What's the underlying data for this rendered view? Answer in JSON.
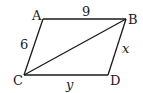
{
  "figure": {
    "type": "parallelogram",
    "vertices": [
      "A",
      "B",
      "C",
      "D"
    ],
    "edges": [
      {
        "from": "A",
        "to": "B",
        "label": "9"
      },
      {
        "from": "B",
        "to": "D",
        "label": "x"
      },
      {
        "from": "C",
        "to": "D",
        "label": "y"
      },
      {
        "from": "A",
        "to": "C",
        "label": "6"
      },
      {
        "from": "C",
        "to": "B",
        "label": ""
      }
    ],
    "vertex_labels": {
      "A": "A",
      "B": "B",
      "C": "C",
      "D": "D"
    },
    "side_labels": {
      "AB": "9",
      "AC": "6",
      "BD": "x",
      "CD": "y"
    }
  }
}
